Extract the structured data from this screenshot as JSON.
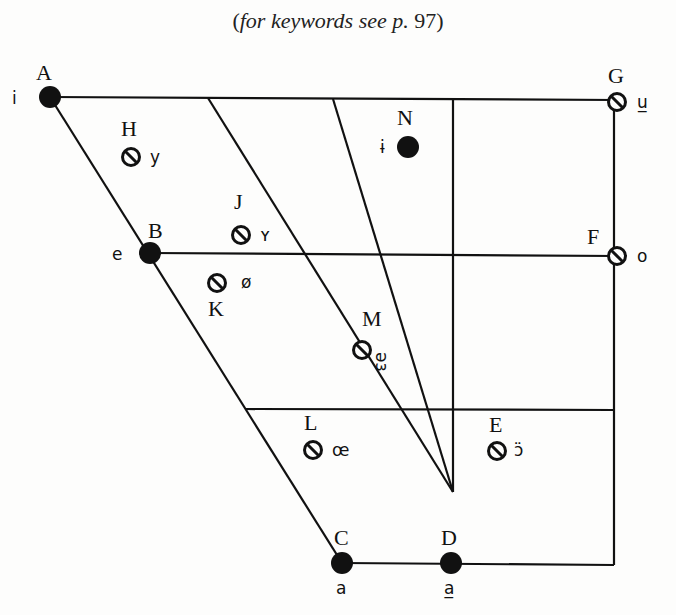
{
  "caption": {
    "open": "(",
    "italic": "for keywords see p.",
    "page": " 97",
    "close": ")"
  },
  "diagram": {
    "type": "cardinal-vowel-chart",
    "line_color": "#111111",
    "points": [
      {
        "id": "A",
        "symbol": "i",
        "style": "filled",
        "x": 50,
        "y": 97
      },
      {
        "id": "B",
        "symbol": "e",
        "style": "filled",
        "x": 150,
        "y": 253
      },
      {
        "id": "C",
        "symbol": "a",
        "style": "filled",
        "x": 342,
        "y": 563
      },
      {
        "id": "D",
        "symbol": "a̲",
        "style": "filled",
        "x": 451,
        "y": 563
      },
      {
        "id": "E",
        "symbol": "ɔ̈",
        "style": "rounded",
        "x": 497,
        "y": 451
      },
      {
        "id": "F",
        "symbol": "o",
        "style": "rounded",
        "x": 617,
        "y": 256
      },
      {
        "id": "G",
        "symbol": "u̲",
        "style": "rounded",
        "x": 617,
        "y": 102
      },
      {
        "id": "H",
        "symbol": "y",
        "style": "rounded",
        "x": 131,
        "y": 157
      },
      {
        "id": "J",
        "symbol": "ʏ",
        "style": "rounded",
        "x": 241,
        "y": 235
      },
      {
        "id": "K",
        "symbol": "ø",
        "style": "rounded",
        "x": 217,
        "y": 283
      },
      {
        "id": "L",
        "symbol": "œ",
        "style": "rounded",
        "x": 313,
        "y": 450
      },
      {
        "id": "M",
        "symbol": "əɜ",
        "style": "rounded",
        "x": 362,
        "y": 350
      },
      {
        "id": "N",
        "symbol": "ɨ",
        "style": "filled",
        "x": 408,
        "y": 147
      }
    ]
  }
}
